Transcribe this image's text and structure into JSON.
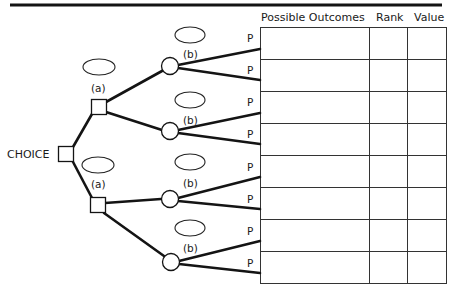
{
  "diagram": {
    "type": "decision-tree",
    "root_label": "CHOICE",
    "decision_node_label": "(a)",
    "chance_node_label": "(b)",
    "probability_label": "P",
    "table": {
      "columns": [
        "Possible Outcomes",
        "Rank",
        "Value"
      ],
      "row_count": 8,
      "rows": [
        {
          "outcome": "",
          "rank": "",
          "value": ""
        },
        {
          "outcome": "",
          "rank": "",
          "value": ""
        },
        {
          "outcome": "",
          "rank": "",
          "value": ""
        },
        {
          "outcome": "",
          "rank": "",
          "value": ""
        },
        {
          "outcome": "",
          "rank": "",
          "value": ""
        },
        {
          "outcome": "",
          "rank": "",
          "value": ""
        },
        {
          "outcome": "",
          "rank": "",
          "value": ""
        },
        {
          "outcome": "",
          "rank": "",
          "value": ""
        }
      ]
    },
    "labels": {
      "a_upper": "(a)",
      "a_lower": "(a)",
      "b1": "(b)",
      "b2": "(b)",
      "b3": "(b)",
      "b4": "(b)",
      "p": [
        "P",
        "P",
        "P",
        "P",
        "P",
        "P",
        "P",
        "P"
      ]
    },
    "colors": {
      "ink": "#141414",
      "background": "#ffffff"
    }
  }
}
